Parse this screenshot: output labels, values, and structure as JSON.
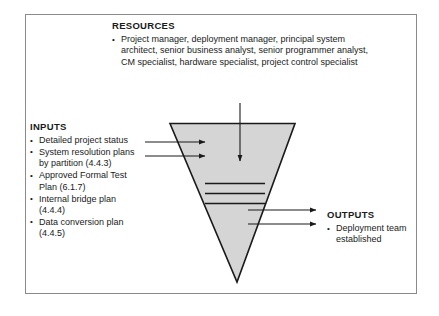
{
  "diagram": {
    "shape": {
      "name": "inverted-triangle",
      "fill_color": "#d5d5d5",
      "stroke_color": "#1a1a1a",
      "internal_line_count": 3
    },
    "arrows": {
      "resources_in": 1,
      "inputs_in": 2,
      "outputs_out": 2
    }
  },
  "resources": {
    "heading": "RESOURCES",
    "items": [
      "Project manager, deployment manager, principal system architect, senior business analyst, senior programmer analyst, CM specialist, hardware specialist, project control specialist"
    ]
  },
  "inputs": {
    "heading": "INPUTS",
    "items": [
      "Detailed project status",
      "System resolution plans by partition (4.4.3)",
      "Approved Formal Test Plan (6.1.7)",
      "Internal bridge plan (4.4.4)",
      "Data conversion plan (4.4.5)"
    ]
  },
  "outputs": {
    "heading": "OUTPUTS",
    "items": [
      "Deployment team established"
    ]
  }
}
